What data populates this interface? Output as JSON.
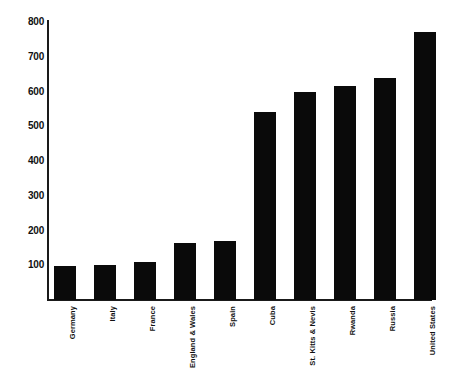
{
  "chart_data": {
    "type": "bar",
    "title": "",
    "subtitle": "",
    "xlabel": "",
    "ylabel": "",
    "ylim": [
      0,
      800
    ],
    "yticks": [
      100,
      200,
      300,
      400,
      500,
      600,
      700,
      800
    ],
    "grid": false,
    "legend": false,
    "bar_color": "#0a0a0a",
    "axis_color": "#1a1a1a",
    "categories": [
      "Germany",
      "Italy",
      "France",
      "England & Wales",
      "Spain",
      "Cuba",
      "St. Kitts & Nevis",
      "Rwanda",
      "Russia",
      "United States"
    ],
    "values": [
      98,
      102,
      108,
      163,
      170,
      540,
      598,
      616,
      639,
      771
    ]
  }
}
